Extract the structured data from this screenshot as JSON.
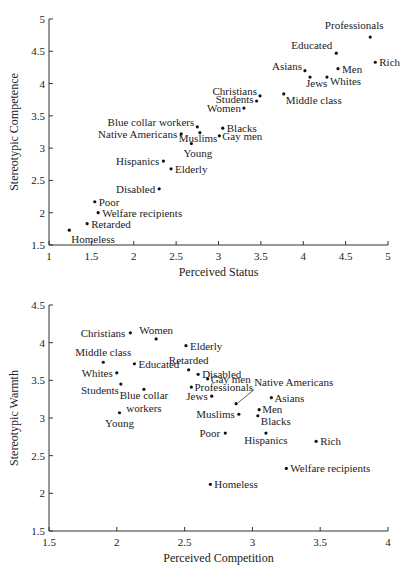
{
  "chart_data": [
    {
      "type": "scatter",
      "title": "",
      "xlabel": "Perceived Status",
      "ylabel": "Stereotypic Competence",
      "xlim": [
        1,
        5
      ],
      "ylim": [
        1.5,
        5
      ],
      "xticks": [
        "1",
        "1.5",
        "2",
        "2.5",
        "3",
        "3.5",
        "4",
        "4.5",
        "5"
      ],
      "yticks": [
        "1.5",
        "2",
        "2.5",
        "3",
        "3.5",
        "4",
        "4.5",
        "5"
      ],
      "grid": false,
      "points": [
        {
          "label": "Professionals",
          "x": 4.79,
          "y": 4.72
        },
        {
          "label": "Educated",
          "x": 4.39,
          "y": 4.47
        },
        {
          "label": "Rich",
          "x": 4.85,
          "y": 4.33
        },
        {
          "label": "Asians",
          "x": 4.02,
          "y": 4.2
        },
        {
          "label": "Men",
          "x": 4.41,
          "y": 4.23
        },
        {
          "label": "Jews",
          "x": 4.08,
          "y": 4.1
        },
        {
          "label": "Whites",
          "x": 4.28,
          "y": 4.1
        },
        {
          "label": "Christians",
          "x": 3.49,
          "y": 3.81
        },
        {
          "label": "Middle class",
          "x": 3.77,
          "y": 3.84
        },
        {
          "label": "Students",
          "x": 3.45,
          "y": 3.73
        },
        {
          "label": "Women",
          "x": 3.3,
          "y": 3.62
        },
        {
          "label": "Blue collar workers",
          "x": 2.75,
          "y": 3.33
        },
        {
          "label": "Blacks",
          "x": 3.05,
          "y": 3.31
        },
        {
          "label": "Native Americans",
          "x": 2.56,
          "y": 3.22
        },
        {
          "label": "Muslims",
          "x": 2.78,
          "y": 3.24
        },
        {
          "label": "Gay men",
          "x": 3.01,
          "y": 3.19
        },
        {
          "label": "Young",
          "x": 2.68,
          "y": 3.07
        },
        {
          "label": "Hispanics",
          "x": 2.35,
          "y": 2.8
        },
        {
          "label": "Elderly",
          "x": 2.44,
          "y": 2.68
        },
        {
          "label": "Disabled",
          "x": 2.3,
          "y": 2.37
        },
        {
          "label": "Poor",
          "x": 1.54,
          "y": 2.17
        },
        {
          "label": "Welfare recipients",
          "x": 1.58,
          "y": 2.0
        },
        {
          "label": "Retarded",
          "x": 1.45,
          "y": 1.83
        },
        {
          "label": "Homeless",
          "x": 1.24,
          "y": 1.73
        }
      ]
    },
    {
      "type": "scatter",
      "title": "",
      "xlabel": "Perceived Competition",
      "ylabel": "Stereotypic Warmth",
      "xlim": [
        1.5,
        4
      ],
      "ylim": [
        1.5,
        4.5
      ],
      "xticks": [
        "1.5",
        "2",
        "2.5",
        "3",
        "3.5",
        "4"
      ],
      "yticks": [
        "1.5",
        "2",
        "2.5",
        "3",
        "3.5",
        "4",
        "4.5"
      ],
      "grid": false,
      "points": [
        {
          "label": "Christians",
          "x": 2.1,
          "y": 4.13
        },
        {
          "label": "Women",
          "x": 2.29,
          "y": 4.05
        },
        {
          "label": "Elderly",
          "x": 2.51,
          "y": 3.96
        },
        {
          "label": "Middle class",
          "x": 1.9,
          "y": 3.74
        },
        {
          "label": "Educated",
          "x": 2.13,
          "y": 3.72
        },
        {
          "label": "Retarded",
          "x": 2.53,
          "y": 3.64
        },
        {
          "label": "Whites",
          "x": 2.0,
          "y": 3.6
        },
        {
          "label": "Disabled",
          "x": 2.6,
          "y": 3.58
        },
        {
          "label": "Gay men",
          "x": 2.67,
          "y": 3.52
        },
        {
          "label": "Students",
          "x": 2.03,
          "y": 3.45
        },
        {
          "label": "Blue collar workers",
          "x": 2.2,
          "y": 3.38
        },
        {
          "label": "Professionals",
          "x": 2.55,
          "y": 3.41
        },
        {
          "label": "Jews",
          "x": 2.7,
          "y": 3.29
        },
        {
          "label": "Native Americans",
          "x": 2.88,
          "y": 3.19
        },
        {
          "label": "Asians",
          "x": 3.14,
          "y": 3.27
        },
        {
          "label": "Men",
          "x": 3.05,
          "y": 3.11
        },
        {
          "label": "Muslims",
          "x": 2.9,
          "y": 3.05
        },
        {
          "label": "Blacks",
          "x": 3.04,
          "y": 3.03
        },
        {
          "label": "Young",
          "x": 2.02,
          "y": 3.07
        },
        {
          "label": "Poor",
          "x": 2.8,
          "y": 2.8
        },
        {
          "label": "Hispanics",
          "x": 3.1,
          "y": 2.8
        },
        {
          "label": "Rich",
          "x": 3.47,
          "y": 2.69
        },
        {
          "label": "Welfare recipients",
          "x": 3.25,
          "y": 2.33
        },
        {
          "label": "Homeless",
          "x": 2.69,
          "y": 2.12
        }
      ]
    }
  ],
  "label_layout": [
    {
      "Professionals": {
        "dx": -16,
        "dy": -8,
        "anchor": "middle"
      },
      "Educated": {
        "dx": -4,
        "dy": -4,
        "anchor": "end"
      },
      "Rich": {
        "dx": 4,
        "dy": 4,
        "anchor": "start"
      },
      "Asians": {
        "dx": -3,
        "dy": -1,
        "anchor": "end"
      },
      "Men": {
        "dx": 4,
        "dy": 4,
        "anchor": "start"
      },
      "Jews": {
        "dx": -4,
        "dy": 10,
        "anchor": "start"
      },
      "Whites": {
        "dx": 3,
        "dy": 8,
        "anchor": "start"
      },
      "Christians": {
        "dx": -3,
        "dy": -1,
        "anchor": "end"
      },
      "Middle class": {
        "dx": 2,
        "dy": 10,
        "anchor": "start"
      },
      "Students": {
        "dx": -3,
        "dy": 2,
        "anchor": "end"
      },
      "Women": {
        "dx": -3,
        "dy": 4,
        "anchor": "end"
      },
      "Blue collar workers": {
        "dx": -3,
        "dy": -1,
        "anchor": "end"
      },
      "Blacks": {
        "dx": 4,
        "dy": 4,
        "anchor": "start"
      },
      "Native Americans": {
        "dx": -4,
        "dy": 4,
        "anchor": "end"
      },
      "Muslims": {
        "dx": -21,
        "dy": 9,
        "anchor": "start"
      },
      "Gay men": {
        "dx": 3,
        "dy": 4,
        "anchor": "start"
      },
      "Young": {
        "dx": -8,
        "dy": 13,
        "anchor": "start"
      },
      "Hispanics": {
        "dx": -4,
        "dy": 4,
        "anchor": "end"
      },
      "Elderly": {
        "dx": 4,
        "dy": 4,
        "anchor": "start"
      },
      "Disabled": {
        "dx": -4,
        "dy": 4,
        "anchor": "end"
      },
      "Poor": {
        "dx": 4,
        "dy": 4,
        "anchor": "start"
      },
      "Welfare recipients": {
        "dx": 4,
        "dy": 4,
        "anchor": "start"
      },
      "Retarded": {
        "dx": 4,
        "dy": 4,
        "anchor": "start"
      },
      "Homeless": {
        "dx": 2,
        "dy": 13,
        "anchor": "start"
      }
    },
    {
      "Christians": {
        "dx": -5,
        "dy": 4,
        "anchor": "end"
      },
      "Women": {
        "dx": 0,
        "dy": -5,
        "anchor": "middle"
      },
      "Elderly": {
        "dx": 4,
        "dy": 4,
        "anchor": "start"
      },
      "Middle class": {
        "dx": 0,
        "dy": -6,
        "anchor": "middle"
      },
      "Educated": {
        "dx": 4,
        "dy": 4,
        "anchor": "start"
      },
      "Retarded": {
        "dx": 0,
        "dy": -6,
        "anchor": "middle"
      },
      "Whites": {
        "dx": -4,
        "dy": 4,
        "anchor": "end"
      },
      "Disabled": {
        "dx": 4,
        "dy": 4,
        "anchor": "start"
      },
      "Gay men": {
        "dx": 3,
        "dy": 4,
        "anchor": "start"
      },
      "Students": {
        "dx": -2,
        "dy": 10,
        "anchor": "end"
      },
      "Blue collar workers": {
        "dx": 0,
        "dy": 10,
        "anchor": "middle"
      },
      "Professionals": {
        "dx": 3,
        "dy": 4,
        "anchor": "start"
      },
      "Jews": {
        "dx": -4,
        "dy": 4,
        "anchor": "end"
      },
      "Native Americans": {
        "dx": 18,
        "dy": -18,
        "anchor": "start"
      },
      "Asians": {
        "dx": 3,
        "dy": 4,
        "anchor": "start"
      },
      "Men": {
        "dx": 3,
        "dy": 3,
        "anchor": "start"
      },
      "Muslims": {
        "dx": -4,
        "dy": 4,
        "anchor": "end"
      },
      "Blacks": {
        "dx": 3,
        "dy": 9,
        "anchor": "start"
      },
      "Young": {
        "dx": 0,
        "dy": 14,
        "anchor": "middle"
      },
      "Poor": {
        "dx": -5,
        "dy": 4,
        "anchor": "end"
      },
      "Hispanics": {
        "dx": 0,
        "dy": 11,
        "anchor": "middle"
      },
      "Rich": {
        "dx": 4,
        "dy": 4,
        "anchor": "start"
      },
      "Welfare recipients": {
        "dx": 4,
        "dy": 4,
        "anchor": "start"
      },
      "Homeless": {
        "dx": 4,
        "dy": 4,
        "anchor": "start"
      }
    }
  ]
}
